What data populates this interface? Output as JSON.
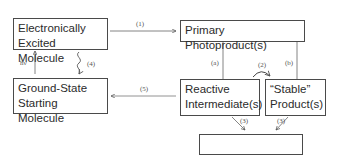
{
  "diagram": {
    "nodes": {
      "excited": {
        "line1": "Electronically",
        "line2": "Excited Molecule"
      },
      "ground": {
        "line1": "Ground-State",
        "line2": "Starting Molecule"
      },
      "primary": {
        "line1": "Primary Photoproduct(s)"
      },
      "reactive": {
        "line1": "Reactive",
        "line2": "Intermediate(s)"
      },
      "stable": {
        "line1": "“Stable”",
        "line2": "Product(s)"
      },
      "bio": {
        "line1": "Biological  Response"
      }
    },
    "edge_labels": {
      "hv": "hν",
      "e1": "(1)",
      "e2": "(2)",
      "e3a": "(3)",
      "e3b": "(3)",
      "e4": "(4)",
      "e5": "(5)",
      "ea": "(a)",
      "eb": "(b)"
    },
    "edges": [
      {
        "from": "ground",
        "to": "excited",
        "label": "hν"
      },
      {
        "from": "excited",
        "to": "primary",
        "label": "(1)"
      },
      {
        "from": "excited",
        "to": "ground",
        "label": "(4)",
        "style": "wavy"
      },
      {
        "from": "primary",
        "to": "reactive",
        "label": "(a)"
      },
      {
        "from": "primary",
        "to": "stable",
        "label": "(b)"
      },
      {
        "from": "reactive",
        "to": "stable",
        "label": "(2)",
        "style": "curved"
      },
      {
        "from": "reactive",
        "to": "ground",
        "label": "(5)"
      },
      {
        "from": "reactive",
        "to": "bio",
        "label": "(3)"
      },
      {
        "from": "stable",
        "to": "bio",
        "label": "(3)"
      }
    ]
  }
}
